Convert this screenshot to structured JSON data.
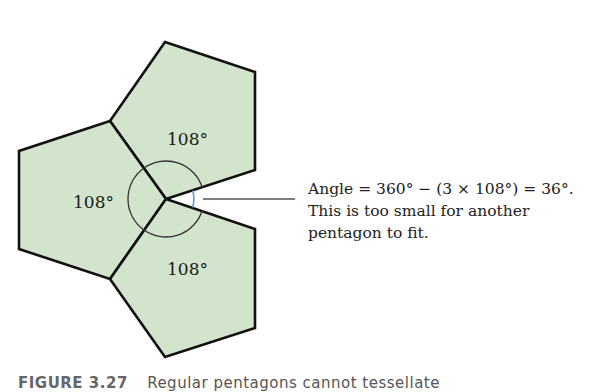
{
  "diagram": {
    "fill_color": "#d3e4cd",
    "stroke_color": "#111111",
    "arc_color": "#333333",
    "gap_arc_color": "#5b9bd5",
    "pentagons": [
      {
        "name": "top",
        "points": "165,42 255,72 255,170 166,199 110,121",
        "label": "108°",
        "label_x": 167,
        "label_y": 145
      },
      {
        "name": "left",
        "points": "110,121 19,151 19,249 110,279 166,199",
        "label": "108°",
        "label_x": 73,
        "label_y": 208
      },
      {
        "name": "bottom",
        "points": "166,199 255,229 255,328 165,357 110,279",
        "label": "108°",
        "label_x": 167,
        "label_y": 275
      }
    ]
  },
  "annotation": {
    "lines": [
      "Angle = 360° − (3 × 108°) = 36°.",
      "This is too small for another",
      "pentagon to fit."
    ]
  },
  "caption": {
    "figure_number": "FIGURE 3.27",
    "text": "Regular pentagons cannot tessellate"
  }
}
